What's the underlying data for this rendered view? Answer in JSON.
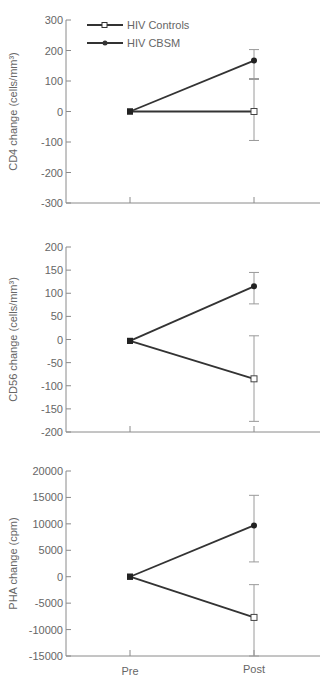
{
  "legend": {
    "items": [
      {
        "label": "HIV Controls",
        "marker": "open-square"
      },
      {
        "label": "HIV CBSM",
        "marker": "filled-circle"
      }
    ]
  },
  "colors": {
    "line": "#333333",
    "axis": "#8a8a8a",
    "error_bar": "#9a9a9a",
    "text": "#666666"
  },
  "chart_data": [
    {
      "type": "line",
      "title": "",
      "xlabel": "",
      "ylabel": "CD4 change (cells/mm³)",
      "categories": [
        "Pre",
        "Post"
      ],
      "ylim": [
        -300,
        300
      ],
      "yticks": [
        300,
        200,
        100,
        0,
        -100,
        -200,
        -300
      ],
      "show_x_labels": false,
      "legend_position": "upper-left",
      "series": [
        {
          "name": "HIV Controls",
          "marker": "open-square",
          "values": [
            0,
            0
          ],
          "error": [
            null,
            {
              "low": -95,
              "high": 108
            }
          ]
        },
        {
          "name": "HIV CBSM",
          "marker": "filled-circle",
          "values": [
            0,
            167
          ],
          "error": [
            null,
            {
              "low": 105,
              "high": 203
            }
          ]
        }
      ],
      "frame": {
        "top": 20,
        "bottom": 203
      }
    },
    {
      "type": "line",
      "title": "",
      "xlabel": "",
      "ylabel": "CD56 change (cells/mm³)",
      "categories": [
        "Pre",
        "Post"
      ],
      "ylim": [
        -200,
        200
      ],
      "yticks": [
        200,
        150,
        100,
        50,
        0,
        -50,
        -100,
        -150,
        -200
      ],
      "show_x_labels": false,
      "series": [
        {
          "name": "HIV Controls",
          "marker": "open-square",
          "values": [
            -3,
            -85
          ],
          "error": [
            null,
            {
              "low": -177,
              "high": 8
            }
          ]
        },
        {
          "name": "HIV CBSM",
          "marker": "filled-circle",
          "values": [
            -3,
            115
          ],
          "error": [
            null,
            {
              "low": 77,
              "high": 145
            }
          ]
        }
      ],
      "frame": {
        "top": 247,
        "bottom": 432
      }
    },
    {
      "type": "line",
      "title": "",
      "xlabel": "",
      "ylabel": "PHA change (cpm)",
      "categories": [
        "Pre",
        "Post"
      ],
      "ylim": [
        -15000,
        20000
      ],
      "yticks": [
        20000,
        15000,
        10000,
        5000,
        0,
        -5000,
        -10000,
        -15000
      ],
      "show_x_labels": true,
      "series": [
        {
          "name": "HIV Controls",
          "marker": "open-square",
          "values": [
            0,
            -7700
          ],
          "error": [
            null,
            {
              "low": -15000,
              "high": -1500
            }
          ]
        },
        {
          "name": "HIV CBSM",
          "marker": "filled-circle",
          "values": [
            0,
            9700
          ],
          "error": [
            null,
            {
              "low": 2800,
              "high": 15400
            }
          ]
        }
      ],
      "frame": {
        "top": 471,
        "bottom": 656
      }
    }
  ]
}
